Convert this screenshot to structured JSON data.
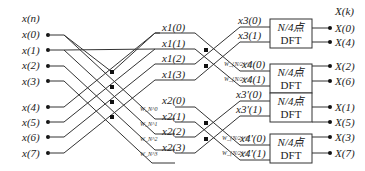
{
  "diagram": {
    "type": "radix-2 decimation-in-frequency FFT signal flow graph (8-point)",
    "input_header": "x(n)",
    "inputs": [
      "x(0)",
      "x(1)",
      "x(2)",
      "x(3)",
      "x(4)",
      "x(5)",
      "x(6)",
      "x(7)"
    ],
    "stage1_upper": [
      "x1(0)",
      "x1(1)",
      "x1(2)",
      "x1(3)"
    ],
    "stage1_lower": [
      "x2(0)",
      "x2(1)",
      "x2(2)",
      "x2(3)"
    ],
    "stage1_twiddles": [
      "W_N^0",
      "W_N^1",
      "W_N^2",
      "W_N^3"
    ],
    "stage2_block_a": [
      "x3(0)",
      "x3(1)",
      "x4(0)",
      "x4(1)"
    ],
    "stage2_block_b": [
      "x3'(0)",
      "x3'(1)",
      "x4'(0)",
      "x4'(1)"
    ],
    "stage2_twiddles": [
      "W_{N/2}^0",
      "W_{N/2}^1"
    ],
    "dft_box": {
      "line1": "N/4点",
      "line2": "DFT"
    },
    "output_header": "X(k)",
    "outputs": [
      "X(0)",
      "X(4)",
      "X(2)",
      "X(6)",
      "X(1)",
      "X(5)",
      "X(3)",
      "X(7)"
    ]
  }
}
